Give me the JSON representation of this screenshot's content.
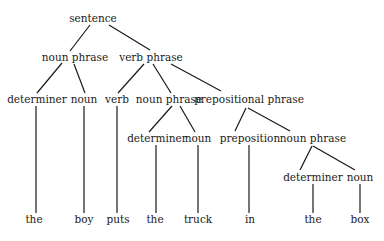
{
  "diagram": {
    "type": "parse-tree",
    "nodes": [
      {
        "id": "s",
        "label": "sentence",
        "x": 93,
        "y": 18
      },
      {
        "id": "np1",
        "label": "noun phrase",
        "x": 75,
        "y": 57
      },
      {
        "id": "vp",
        "label": "verb phrase",
        "x": 151,
        "y": 57
      },
      {
        "id": "det1",
        "label": "determiner",
        "x": 37,
        "y": 99
      },
      {
        "id": "n1",
        "label": "noun",
        "x": 84,
        "y": 99
      },
      {
        "id": "v",
        "label": "verb",
        "x": 117,
        "y": 99
      },
      {
        "id": "np2",
        "label": "noun phrase",
        "x": 169,
        "y": 99
      },
      {
        "id": "pp",
        "label": "prepositional phrase",
        "x": 249,
        "y": 99
      },
      {
        "id": "det2",
        "label": "determiner",
        "x": 157,
        "y": 138
      },
      {
        "id": "n2",
        "label": "noun",
        "x": 198,
        "y": 138
      },
      {
        "id": "prep",
        "label": "preposition",
        "x": 250,
        "y": 138
      },
      {
        "id": "np3",
        "label": "noun phrase",
        "x": 313,
        "y": 138
      },
      {
        "id": "det3",
        "label": "determiner",
        "x": 313,
        "y": 177
      },
      {
        "id": "n3",
        "label": "noun",
        "x": 360,
        "y": 177
      },
      {
        "id": "w1",
        "label": "the",
        "x": 34,
        "y": 219
      },
      {
        "id": "w2",
        "label": "boy",
        "x": 84,
        "y": 219
      },
      {
        "id": "w3",
        "label": "puts",
        "x": 118,
        "y": 219
      },
      {
        "id": "w4",
        "label": "the",
        "x": 155,
        "y": 219
      },
      {
        "id": "w5",
        "label": "truck",
        "x": 198,
        "y": 219
      },
      {
        "id": "w6",
        "label": "in",
        "x": 250,
        "y": 219
      },
      {
        "id": "w7",
        "label": "the",
        "x": 313,
        "y": 219
      },
      {
        "id": "w8",
        "label": "box",
        "x": 360,
        "y": 219
      }
    ],
    "edges": [
      {
        "from": "s",
        "to": "np1",
        "x1": 90,
        "y1": 25,
        "x2": 70,
        "y2": 51
      },
      {
        "from": "s",
        "to": "vp",
        "x1": 109,
        "y1": 25,
        "x2": 150,
        "y2": 50
      },
      {
        "from": "np1",
        "to": "det1",
        "x1": 62,
        "y1": 63,
        "x2": 37,
        "y2": 93
      },
      {
        "from": "np1",
        "to": "n1",
        "x1": 74,
        "y1": 64,
        "x2": 85,
        "y2": 93
      },
      {
        "from": "vp",
        "to": "v",
        "x1": 144,
        "y1": 64,
        "x2": 118,
        "y2": 93
      },
      {
        "from": "vp",
        "to": "np2",
        "x1": 153,
        "y1": 64,
        "x2": 171,
        "y2": 93
      },
      {
        "from": "vp",
        "to": "pp",
        "x1": 171,
        "y1": 64,
        "x2": 221,
        "y2": 91
      },
      {
        "from": "det1",
        "to": "w1",
        "x1": 36,
        "y1": 106,
        "x2": 36,
        "y2": 213
      },
      {
        "from": "n1",
        "to": "w2",
        "x1": 84,
        "y1": 106,
        "x2": 84,
        "y2": 213
      },
      {
        "from": "v",
        "to": "w3",
        "x1": 117,
        "y1": 106,
        "x2": 117,
        "y2": 213
      },
      {
        "from": "np2",
        "to": "det2",
        "x1": 172,
        "y1": 106,
        "x2": 149,
        "y2": 132
      },
      {
        "from": "np2",
        "to": "n2",
        "x1": 180,
        "y1": 106,
        "x2": 195,
        "y2": 132
      },
      {
        "from": "pp",
        "to": "prep",
        "x1": 246,
        "y1": 108,
        "x2": 235,
        "y2": 131
      },
      {
        "from": "pp",
        "to": "np3",
        "x1": 248,
        "y1": 108,
        "x2": 290,
        "y2": 131
      },
      {
        "from": "det2",
        "to": "w4",
        "x1": 156,
        "y1": 145,
        "x2": 156,
        "y2": 213
      },
      {
        "from": "n2",
        "to": "w5",
        "x1": 198,
        "y1": 145,
        "x2": 198,
        "y2": 213
      },
      {
        "from": "prep",
        "to": "w6",
        "x1": 249,
        "y1": 145,
        "x2": 249,
        "y2": 213
      },
      {
        "from": "np3",
        "to": "det3",
        "x1": 312,
        "y1": 146,
        "x2": 300,
        "y2": 170
      },
      {
        "from": "np3",
        "to": "n3",
        "x1": 313,
        "y1": 146,
        "x2": 355,
        "y2": 170
      },
      {
        "from": "det3",
        "to": "w7",
        "x1": 313,
        "y1": 184,
        "x2": 313,
        "y2": 213
      },
      {
        "from": "n3",
        "to": "w8",
        "x1": 360,
        "y1": 184,
        "x2": 360,
        "y2": 213
      }
    ]
  }
}
